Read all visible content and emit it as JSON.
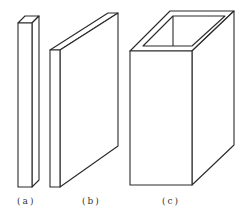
{
  "figure": {
    "stroke_color": "#2a2a2a",
    "background": "#ffffff",
    "items": [
      {
        "id": "a",
        "label": "(a)",
        "shape": "slender-bar"
      },
      {
        "id": "b",
        "label": "(b)",
        "shape": "thin-plate"
      },
      {
        "id": "c",
        "label": "(c)",
        "shape": "hollow-box-tube"
      }
    ]
  }
}
